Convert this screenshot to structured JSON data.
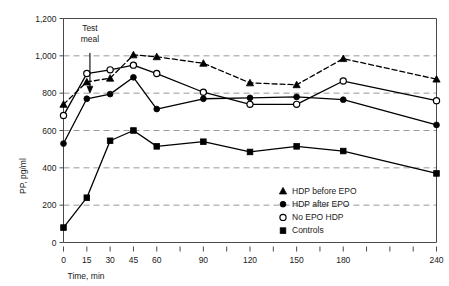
{
  "chart_data": {
    "type": "line",
    "title": "",
    "xlabel": "Time, min",
    "ylabel": "PP, pg/ml",
    "xlim": [
      0,
      240
    ],
    "ylim": [
      0,
      1200
    ],
    "grid": true,
    "legend_position": "inside-bottom-right",
    "x": [
      0,
      15,
      30,
      45,
      60,
      90,
      120,
      150,
      180,
      240
    ],
    "x_tick_values": [
      0,
      15,
      30,
      45,
      60,
      75,
      90,
      105,
      120,
      135,
      150,
      165,
      180,
      195,
      210,
      225,
      240
    ],
    "x_tick_labels": [
      "0",
      "15",
      "30",
      "45",
      "60",
      "",
      "90",
      "",
      "120",
      "",
      "150",
      "",
      "180",
      "",
      "",
      "",
      "240"
    ],
    "y_tick_values": [
      0,
      200,
      400,
      600,
      800,
      1000,
      1200
    ],
    "y_tick_labels": [
      "0",
      "200",
      "400",
      "600",
      "800",
      "1,000",
      "1,200"
    ],
    "gridline_values": [
      200,
      400,
      600,
      800,
      1000
    ],
    "series": [
      {
        "name": "HDP before EPO",
        "marker": "triangle-filled",
        "line_style": "dashed",
        "x": [
          0,
          15,
          30,
          45,
          60,
          90,
          120,
          150,
          180,
          240
        ],
        "values": [
          740,
          860,
          880,
          1005,
          995,
          960,
          855,
          845,
          985,
          875
        ]
      },
      {
        "name": "HDP after EPO",
        "marker": "circle-filled",
        "line_style": "solid",
        "x": [
          0,
          15,
          30,
          45,
          60,
          90,
          120,
          150,
          180,
          240
        ],
        "values": [
          530,
          770,
          795,
          885,
          715,
          770,
          775,
          780,
          765,
          630
        ]
      },
      {
        "name": "No EPO HDP",
        "marker": "circle-open",
        "line_style": "solid",
        "x": [
          0,
          15,
          30,
          45,
          60,
          90,
          120,
          150,
          180,
          240
        ],
        "values": [
          680,
          905,
          925,
          950,
          905,
          805,
          740,
          740,
          865,
          760
        ]
      },
      {
        "name": "Controls",
        "marker": "square-filled",
        "line_style": "solid",
        "x": [
          0,
          15,
          30,
          45,
          60,
          90,
          120,
          150,
          180,
          240
        ],
        "values": [
          80,
          240,
          545,
          600,
          515,
          540,
          485,
          515,
          490,
          370
        ]
      }
    ],
    "annotations": [
      {
        "name": "test-meal",
        "text_lines": [
          "Test",
          "meal"
        ],
        "x": 8,
        "y_text_top": 1135,
        "arrow_from_y": 1015,
        "arrow_to_y": 800
      }
    ],
    "legend": [
      {
        "label": "HDP before EPO",
        "marker": "triangle-filled"
      },
      {
        "label": "HDP after EPO",
        "marker": "circle-filled"
      },
      {
        "label": "No EPO HDP",
        "marker": "circle-open"
      },
      {
        "label": "Controls",
        "marker": "square-filled"
      }
    ],
    "colors": {
      "line": "#000000",
      "grid": "#9a9a9a",
      "axis": "#4a4a4a",
      "background": "#ffffff",
      "text": "#1a1a1a"
    }
  }
}
